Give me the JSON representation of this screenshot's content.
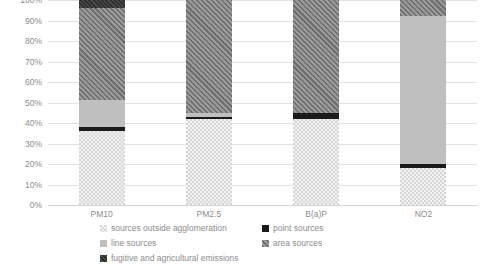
{
  "chart_data": {
    "type": "bar",
    "stacked": true,
    "title": "",
    "subtitle": "",
    "xlabel": "",
    "ylabel": "",
    "categories": [
      "PM10",
      "PM2.5",
      "B(a)P",
      "NO2"
    ],
    "ylim": [
      0,
      100
    ],
    "y_unit": "%",
    "y_ticks": [
      "0%",
      "10%",
      "20%",
      "30%",
      "40%",
      "50%",
      "60%",
      "70%",
      "80%",
      "90%",
      "100%"
    ],
    "y_tick_values": [
      0,
      10,
      20,
      30,
      40,
      50,
      60,
      70,
      80,
      90,
      100
    ],
    "grid": true,
    "grid_axis": "y",
    "legend_position": "bottom",
    "series": [
      {
        "name": "sources outside agglomeration",
        "pattern": "light-checker",
        "color": "#d6d6d6",
        "values": [
          36,
          42,
          42,
          18
        ]
      },
      {
        "name": "point  sources",
        "pattern": "solid-black",
        "color": "#1a1a1a",
        "values": [
          2,
          1,
          3,
          2
        ]
      },
      {
        "name": "line sources",
        "pattern": "solid-light-grey",
        "color": "#bfbfbf",
        "values": [
          13,
          2,
          0,
          72
        ]
      },
      {
        "name": "area sources",
        "pattern": "dark-diagonal-hatch",
        "color": "#9a9a9a",
        "values": [
          45,
          55,
          55,
          8
        ]
      },
      {
        "name": "fugitive and agricultural emissions",
        "pattern": "dark-speckle",
        "color": "#4a4a4a",
        "values": [
          4,
          0,
          0,
          0
        ]
      }
    ]
  },
  "legend": {
    "items": [
      {
        "label": "sources outside agglomeration",
        "swatch": "light-checker-swatch"
      },
      {
        "label": "point  sources",
        "swatch": "solid-black-swatch"
      },
      {
        "label": "line sources",
        "swatch": "solid-light-grey-swatch"
      },
      {
        "label": "area sources",
        "swatch": "dark-diagonal-hatch-swatch"
      },
      {
        "label": "fugitive and agricultural emissions",
        "swatch": "dark-speckle-swatch"
      }
    ]
  }
}
